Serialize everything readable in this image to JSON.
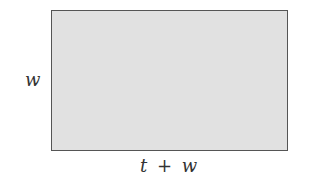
{
  "diagram": {
    "shape": "rectangle",
    "fill_color": "#e1e1e1",
    "stroke_color": "#555555",
    "side_label": "w",
    "bottom_label": "t + w"
  }
}
